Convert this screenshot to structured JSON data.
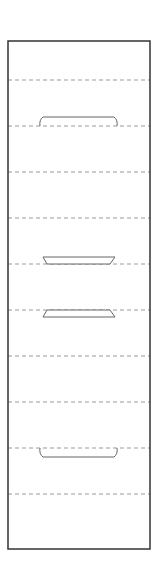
{
  "diagram": {
    "title": "",
    "canvas": {
      "width": 159,
      "height": 574,
      "background": "#ffffff"
    },
    "frame": {
      "x": 8,
      "y": 41,
      "width": 142,
      "height": 508,
      "stroke": "#333333",
      "stroke_width": 1.5
    },
    "dashed_lines": {
      "stroke": "#999999",
      "dasharray": "4,3",
      "y_positions": [
        80,
        126,
        172,
        218,
        264,
        310,
        356,
        402,
        448,
        494
      ]
    },
    "shapes": [
      {
        "type": "slot-upper",
        "name": "top-slot",
        "x1": 40,
        "x2": 117,
        "y_top": 117,
        "y_bottom": 126
      },
      {
        "type": "trapezoid-down",
        "name": "upper-trapezoid",
        "top_x1": 43,
        "top_x2": 115,
        "bottom_x1": 47,
        "bottom_x2": 110,
        "y_top": 257,
        "y_bottom": 264
      },
      {
        "type": "trapezoid-up",
        "name": "lower-trapezoid",
        "top_x1": 47,
        "top_x2": 110,
        "bottom_x1": 43,
        "bottom_x2": 115,
        "y_top": 310,
        "y_bottom": 317
      },
      {
        "type": "slot-lower",
        "name": "bottom-slot",
        "x1": 40,
        "x2": 117,
        "y_top": 448,
        "y_bottom": 457
      }
    ],
    "shape_stroke": "#666666"
  }
}
